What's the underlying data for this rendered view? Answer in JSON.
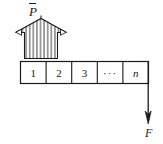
{
  "figure": {
    "stroke_color": "#1a1a1a",
    "fill_color": "#ffffff",
    "hatch_color": "#4a4a4a",
    "load_arrow": {
      "label": "P",
      "label_accent": "overbar",
      "direction": "up",
      "style": "hatched-block-arrow",
      "hatch_count": 9
    },
    "force_arrow": {
      "label": "F",
      "direction": "down",
      "style": "line-with-solid-arrowhead"
    },
    "cells": [
      {
        "label": "1",
        "italic": false
      },
      {
        "label": "2",
        "italic": false
      },
      {
        "label": "3",
        "italic": false
      },
      {
        "label": "···",
        "italic": false
      },
      {
        "label": "n",
        "italic": true
      }
    ]
  }
}
